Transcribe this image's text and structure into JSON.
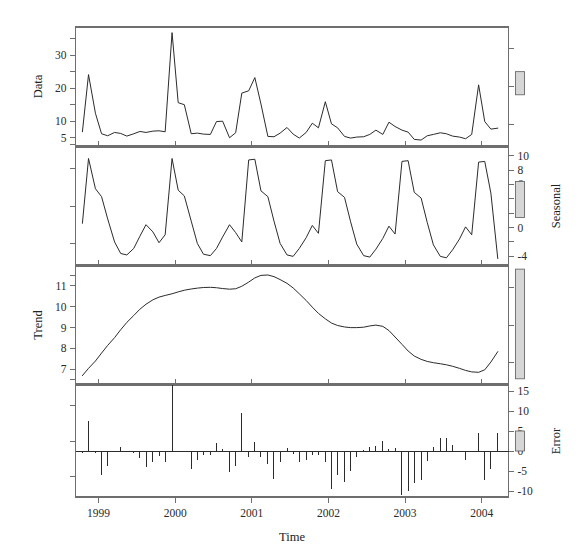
{
  "figure": {
    "width": 578,
    "height": 555,
    "background": "#ffffff",
    "line_color": "#2b2b2b",
    "axis_color": "#6e6e6e",
    "scalebar_fill": "#d6d6d6"
  },
  "axes": {
    "x_title": "Time",
    "x_ticklabels": [
      "1999",
      "2000",
      "2001",
      "2002",
      "2003",
      "2004"
    ],
    "x_tickvalues": [
      1999,
      2000,
      2001,
      2002,
      2003,
      2004
    ],
    "x_range": [
      1998.7,
      2004.35
    ]
  },
  "panels": [
    {
      "name": "data",
      "ylabel": "Data",
      "label_side": "left",
      "ticklabels": [
        "5",
        "10",
        "20",
        "30"
      ],
      "tickvalues": [
        5,
        10,
        20,
        30
      ],
      "ylim": [
        2.5,
        38.5
      ],
      "scalebar": {
        "low": 18.0,
        "high": 25.0
      }
    },
    {
      "name": "seasonal",
      "ylabel": "Seasonal",
      "label_side": "right",
      "ticklabels": [
        "10",
        "8",
        "6",
        "4",
        "2",
        "0",
        "-4"
      ],
      "tickvalues": [
        10,
        8,
        6,
        4,
        2,
        0,
        -4
      ],
      "ylim": [
        -5.2,
        11.2
      ],
      "scalebar": {
        "low": 1.4,
        "high": 6.4
      }
    },
    {
      "name": "trend",
      "ylabel": "Trend",
      "label_side": "left",
      "ticklabels": [
        "11",
        "10",
        "9",
        "8",
        "7"
      ],
      "tickvalues": [
        11,
        10,
        9,
        8,
        7
      ],
      "ylim": [
        6.3,
        11.95
      ],
      "scalebar": {
        "low": 6.55,
        "high": 11.8
      }
    },
    {
      "name": "error",
      "ylabel": "Error",
      "label_side": "right",
      "ticklabels": [
        "15",
        "10",
        "5",
        "0",
        "-5",
        "-10"
      ],
      "tickvalues": [
        15,
        10,
        5,
        0,
        -5,
        -10
      ],
      "ylim": [
        -11.5,
        16.5
      ],
      "scalebar": {
        "low": 0.0,
        "high": 5.0
      }
    }
  ],
  "chart_data": {
    "type": "line",
    "title": "",
    "subtitle": "",
    "xlabel": "Time",
    "ylabel": "",
    "grid": false,
    "legend": "none",
    "x": [
      1998.79,
      1998.87,
      1998.96,
      1999.04,
      1999.12,
      1999.21,
      1999.29,
      1999.37,
      1999.46,
      1999.54,
      1999.62,
      1999.71,
      1999.79,
      1999.87,
      1999.96,
      2000.04,
      2000.12,
      2000.21,
      2000.29,
      2000.37,
      2000.46,
      2000.54,
      2000.62,
      2000.71,
      2000.79,
      2000.87,
      2000.96,
      2001.04,
      2001.12,
      2001.21,
      2001.29,
      2001.37,
      2001.46,
      2001.54,
      2001.62,
      2001.71,
      2001.79,
      2001.87,
      2001.96,
      2002.04,
      2002.12,
      2002.21,
      2002.29,
      2002.37,
      2002.46,
      2002.54,
      2002.62,
      2002.71,
      2002.79,
      2002.87,
      2002.96,
      2003.04,
      2003.12,
      2003.21,
      2003.29,
      2003.37,
      2003.46,
      2003.54,
      2003.62,
      2003.71,
      2003.79,
      2003.87,
      2003.96,
      2004.04,
      2004.12,
      2004.21
    ],
    "series": [
      {
        "name": "Data",
        "panel": "data",
        "ylim": [
          2.5,
          38.5
        ],
        "values": [
          6.8,
          24.1,
          12.4,
          6.2,
          5.6,
          6.6,
          6.3,
          5.5,
          6.2,
          6.9,
          6.6,
          7.0,
          7.1,
          6.8,
          36.8,
          15.6,
          15.0,
          6.2,
          6.4,
          6.1,
          6.0,
          9.9,
          10.0,
          5.0,
          6.5,
          18.5,
          19.2,
          23.2,
          15.2,
          5.4,
          5.3,
          6.4,
          8.1,
          6.1,
          4.9,
          6.6,
          9.4,
          8.0,
          15.9,
          9.2,
          8.0,
          5.4,
          4.9,
          5.2,
          5.3,
          6.0,
          7.3,
          6.0,
          9.7,
          8.4,
          7.3,
          6.7,
          4.5,
          4.3,
          5.6,
          6.0,
          6.5,
          6.2,
          5.5,
          5.2,
          4.7,
          6.0,
          21.0,
          9.9,
          7.6,
          7.9
        ]
      },
      {
        "name": "Seasonal",
        "panel": "seasonal",
        "ylim": [
          -5.2,
          11.2
        ],
        "values": [
          0.6,
          9.6,
          5.4,
          4.3,
          1.2,
          -2.0,
          -3.6,
          -3.8,
          -2.9,
          -1.2,
          0.4,
          -0.6,
          -2.1,
          -1.0,
          9.6,
          5.2,
          4.4,
          0.9,
          -2.2,
          -3.7,
          -3.9,
          -2.9,
          -1.3,
          0.4,
          -0.7,
          -2.0,
          9.4,
          9.5,
          5.1,
          4.3,
          0.9,
          -2.2,
          -3.8,
          -4.0,
          -2.9,
          -1.4,
          0.3,
          -0.8,
          9.3,
          9.4,
          5.0,
          4.2,
          0.8,
          -2.3,
          -3.9,
          -4.1,
          -3.0,
          -1.5,
          0.2,
          -0.9,
          9.2,
          9.3,
          4.9,
          4.1,
          0.7,
          -2.4,
          -4.0,
          -4.2,
          -3.1,
          -1.6,
          0.1,
          -1.0,
          9.1,
          9.2,
          4.8,
          -4.3
        ]
      },
      {
        "name": "Trend",
        "panel": "trend",
        "ylim": [
          6.3,
          11.95
        ],
        "values": [
          6.7,
          7.05,
          7.4,
          7.78,
          8.15,
          8.52,
          8.9,
          9.25,
          9.58,
          9.88,
          10.12,
          10.33,
          10.46,
          10.54,
          10.62,
          10.71,
          10.79,
          10.85,
          10.89,
          10.92,
          10.93,
          10.91,
          10.87,
          10.84,
          10.86,
          10.98,
          11.18,
          11.38,
          11.5,
          11.52,
          11.44,
          11.3,
          11.12,
          10.9,
          10.62,
          10.3,
          9.98,
          9.68,
          9.42,
          9.22,
          9.1,
          9.03,
          9.0,
          9.0,
          9.02,
          9.08,
          9.12,
          9.06,
          8.86,
          8.55,
          8.2,
          7.88,
          7.64,
          7.48,
          7.38,
          7.32,
          7.27,
          7.22,
          7.15,
          7.05,
          6.95,
          6.88,
          6.86,
          6.98,
          7.35,
          7.85
        ]
      },
      {
        "name": "Error",
        "panel": "error",
        "type": "stem",
        "ylim": [
          -11.5,
          16.5
        ],
        "values": [
          -0.5,
          7.4,
          -0.4,
          -5.9,
          -3.7,
          0.1,
          1.0,
          0.1,
          -0.5,
          -1.8,
          -3.9,
          -2.7,
          -1.3,
          -2.7,
          16.6,
          -0.3,
          -0.2,
          -4.6,
          -2.3,
          -1.1,
          -1.0,
          1.9,
          0.4,
          -5.2,
          -3.7,
          9.5,
          -1.4,
          2.3,
          -1.4,
          -3.2,
          -7.0,
          -2.7,
          0.8,
          -0.8,
          -2.8,
          -2.3,
          -0.9,
          -0.9,
          -2.8,
          -9.6,
          -6.1,
          -7.8,
          -4.9,
          -1.5,
          0.2,
          1.0,
          1.2,
          2.4,
          0.6,
          0.7,
          -11.1,
          -9.9,
          -8.0,
          -7.3,
          -2.5,
          1.1,
          3.2,
          3.2,
          1.4,
          -0.2,
          -2.3,
          0.1,
          4.6,
          -7.3,
          -4.5,
          4.4
        ]
      }
    ]
  }
}
